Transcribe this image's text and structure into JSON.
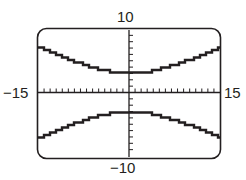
{
  "window": {
    "xmin": "-15",
    "xmax": "15",
    "ymin": "-10",
    "ymax": "10",
    "xscl": 1,
    "yscl": 1
  },
  "colors": {
    "frame": "#231f20",
    "curve": "#231f20",
    "axis": "#231f20",
    "background": "#ffffff"
  },
  "chart_data": {
    "type": "line",
    "title": "",
    "xlabel": "",
    "ylabel": "",
    "xlim": [
      -15,
      15
    ],
    "ylim": [
      -10,
      10
    ],
    "grid": false,
    "tick_labels": {
      "left": "-15",
      "right": "15",
      "top": "10",
      "bottom": "-10"
    },
    "series": [
      {
        "name": "upper branch",
        "x": [
          -15,
          -12,
          -9,
          -6,
          -3,
          0,
          3,
          6,
          9,
          12,
          15
        ],
        "y": [
          7.1,
          5.96,
          4.89,
          3.95,
          3.26,
          3.0,
          3.26,
          3.95,
          4.89,
          5.96,
          7.1
        ]
      },
      {
        "name": "lower branch",
        "x": [
          -15,
          -12,
          -9,
          -6,
          -3,
          0,
          3,
          6,
          9,
          12,
          15
        ],
        "y": [
          -7.1,
          -5.96,
          -4.89,
          -3.95,
          -3.26,
          -3.0,
          -3.26,
          -3.95,
          -4.89,
          -5.96,
          -7.1
        ]
      }
    ]
  }
}
